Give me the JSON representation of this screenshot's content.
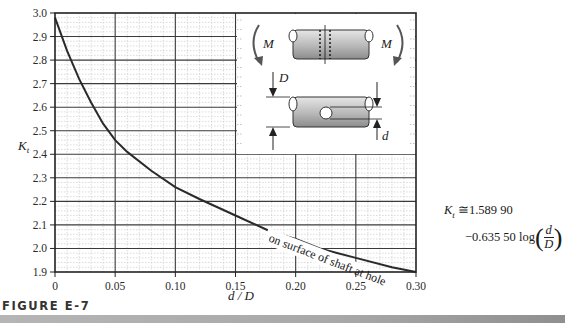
{
  "figure": {
    "caption": "FIGURE E-7",
    "annotation": "on surface of shaft at hole",
    "formula": {
      "lhs": "K",
      "lhs_sub": "t",
      "approx": "≅",
      "const": "1.589 90",
      "coef": "−0.635 50 log",
      "frac_num": "d",
      "frac_den": "D"
    },
    "inset": {
      "moment_label_left": "M",
      "moment_label_right": "M",
      "diameter_label": "D",
      "hole_label": "d"
    }
  },
  "chart_data": {
    "type": "line",
    "title": "",
    "xlabel": "d / D",
    "ylabel": "Kt",
    "xlim": [
      0,
      0.3
    ],
    "ylim": [
      1.9,
      3.0
    ],
    "grid": true,
    "legend": null,
    "xticks": [
      "0",
      "0.05",
      "0.10",
      "0.15",
      "0.20",
      "0.25",
      "0.30"
    ],
    "yticks": [
      "1.9",
      "2.0",
      "2.1",
      "2.2",
      "2.3",
      "2.4",
      "2.5",
      "2.6",
      "2.7",
      "2.8",
      "2.9",
      "3.0"
    ],
    "series": [
      {
        "name": "on surface of shaft at hole",
        "x": [
          0.0,
          0.01,
          0.02,
          0.03,
          0.04,
          0.05,
          0.06,
          0.08,
          0.1,
          0.12,
          0.15,
          0.18,
          0.2,
          0.22,
          0.25,
          0.28,
          0.3
        ],
        "y": [
          2.98,
          2.84,
          2.72,
          2.62,
          2.53,
          2.46,
          2.41,
          2.33,
          2.26,
          2.21,
          2.14,
          2.07,
          2.04,
          2.0,
          1.96,
          1.92,
          1.9
        ]
      }
    ],
    "annotations": [
      "on surface of shaft at hole",
      "Kt ≅ 1.589 90 − 0.635 50 log(d/D)"
    ]
  }
}
